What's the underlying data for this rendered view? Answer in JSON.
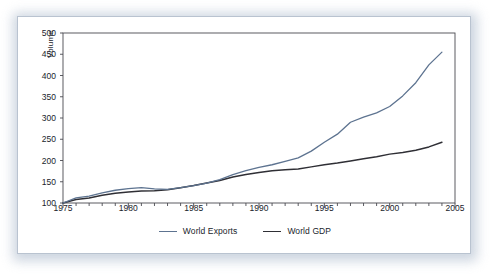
{
  "chart_data": {
    "type": "line",
    "title": "",
    "xlabel": "",
    "ylabel": "Volume",
    "xlim": [
      1975,
      2005
    ],
    "ylim": [
      100,
      500
    ],
    "ytick_labels": [
      "500",
      "450",
      "400",
      "350",
      "300",
      "250",
      "200",
      "150",
      "100"
    ],
    "ytick_values": [
      500,
      450,
      400,
      350,
      300,
      250,
      200,
      150,
      100
    ],
    "xtick_labels": [
      "1975",
      "1980",
      "1985",
      "1990",
      "1995",
      "2000",
      "2005"
    ],
    "xtick_values": [
      1975,
      1980,
      1985,
      1990,
      1995,
      2000,
      2005
    ],
    "x_minor_tick_step": 1,
    "grid": false,
    "legend_position": "bottom-center",
    "x": [
      1975,
      1976,
      1977,
      1978,
      1979,
      1980,
      1981,
      1982,
      1983,
      1984,
      1985,
      1986,
      1987,
      1988,
      1989,
      1990,
      1991,
      1992,
      1993,
      1994,
      1995,
      1996,
      1997,
      1998,
      1999,
      2000,
      2001,
      2002,
      2003,
      2004
    ],
    "series": [
      {
        "name": "World Exports",
        "color": "#5d7390",
        "values": [
          100,
          111,
          115,
          122,
          128,
          133,
          134,
          130,
          129,
          133,
          140,
          147,
          154,
          165,
          172,
          180,
          188,
          196,
          204,
          213,
          222,
          238,
          257,
          267,
          272,
          278,
          291,
          312,
          345,
          380
        ]
      },
      {
        "name": "World GDP",
        "color": "#2f2f35",
        "values": [
          100,
          108,
          112,
          117,
          122,
          125,
          127,
          128,
          130,
          134,
          140,
          146,
          152,
          160,
          166,
          171,
          175,
          178,
          179,
          182,
          186,
          190,
          195,
          200,
          206,
          212,
          216,
          221,
          229,
          238
        ]
      }
    ],
    "series_exports_points": [
      [
        1975,
        100
      ],
      [
        1976,
        112
      ],
      [
        1977,
        116
      ],
      [
        1978,
        124
      ],
      [
        1979,
        130
      ],
      [
        1980,
        134
      ],
      [
        1981,
        136
      ],
      [
        1982,
        133
      ],
      [
        1983,
        132
      ],
      [
        1984,
        136
      ],
      [
        1985,
        141
      ],
      [
        1986,
        147
      ],
      [
        1987,
        155
      ],
      [
        1988,
        167
      ],
      [
        1989,
        176
      ],
      [
        1990,
        184
      ],
      [
        1991,
        190
      ],
      [
        1992,
        198
      ],
      [
        1993,
        206
      ],
      [
        1994,
        222
      ],
      [
        1995,
        243
      ],
      [
        1996,
        262
      ],
      [
        1997,
        290
      ],
      [
        1998,
        302
      ],
      [
        1999,
        312
      ],
      [
        2000,
        327
      ],
      [
        2001,
        352
      ],
      [
        2002,
        383
      ],
      [
        2003,
        425
      ],
      [
        2004,
        455
      ]
    ],
    "series_gdp_points": [
      [
        1975,
        100
      ],
      [
        1976,
        108
      ],
      [
        1977,
        112
      ],
      [
        1978,
        118
      ],
      [
        1979,
        123
      ],
      [
        1980,
        126
      ],
      [
        1981,
        128
      ],
      [
        1982,
        129
      ],
      [
        1983,
        131
      ],
      [
        1984,
        136
      ],
      [
        1985,
        141
      ],
      [
        1986,
        147
      ],
      [
        1987,
        153
      ],
      [
        1988,
        161
      ],
      [
        1989,
        167
      ],
      [
        1990,
        172
      ],
      [
        1991,
        176
      ],
      [
        1992,
        178
      ],
      [
        1993,
        180
      ],
      [
        1994,
        185
      ],
      [
        1995,
        190
      ],
      [
        1996,
        194
      ],
      [
        1997,
        199
      ],
      [
        1998,
        204
      ],
      [
        1999,
        209
      ],
      [
        2000,
        215
      ],
      [
        2001,
        219
      ],
      [
        2002,
        224
      ],
      [
        2003,
        232
      ],
      [
        2004,
        243
      ]
    ],
    "annotations": []
  },
  "legend": {
    "items": [
      {
        "label": "World Exports",
        "color": "#5d7390"
      },
      {
        "label": "World GDP",
        "color": "#2f2f35"
      }
    ]
  },
  "axes": {
    "y_title": "Volume"
  },
  "colors": {
    "exports_line": "#5d7390",
    "gdp_line": "#2f2f35",
    "axis": "#4a4a50",
    "card_border": "#b9c3d0",
    "shadow": "#c3cdda",
    "text": "#20242b"
  }
}
